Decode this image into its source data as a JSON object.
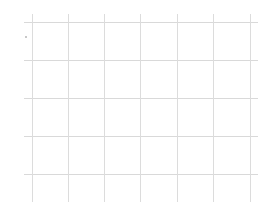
{
  "chart_data": {
    "type": "line",
    "title": "",
    "xlabel": "",
    "ylabel": "",
    "series": [],
    "grid": true,
    "legend": null,
    "grid_lines": {
      "horizontal_y_px": [
        22,
        60,
        98,
        136,
        174
      ],
      "vertical_x_px": [
        32,
        68,
        104,
        140,
        177,
        213,
        250
      ],
      "color": "#d9d9d9"
    }
  }
}
